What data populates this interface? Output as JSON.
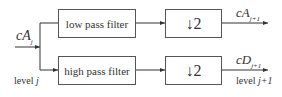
{
  "diagram": {
    "input": {
      "main": "cA",
      "sub": "j"
    },
    "filters": {
      "low": "low pass filter",
      "high": "high pass filter"
    },
    "downsample": {
      "top": "↓2",
      "bottom": "↓2"
    },
    "outputs": {
      "approx": {
        "main": "cA",
        "sub": "j+1"
      },
      "detail": {
        "main": "cD",
        "sub": "j+1"
      }
    },
    "levels": {
      "input_prefix": "level",
      "input_var": "j",
      "output_prefix": "level",
      "output_var": "j+1"
    }
  }
}
